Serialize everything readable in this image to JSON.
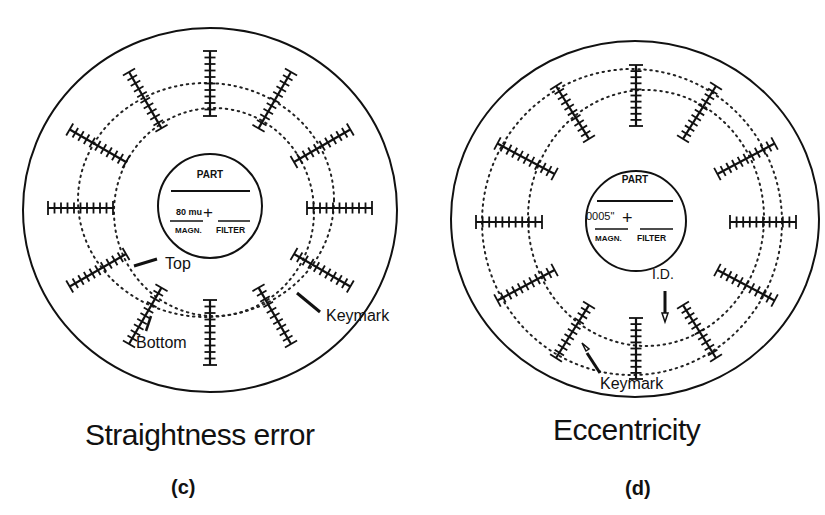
{
  "panels": [
    {
      "id": "c",
      "title": "Straightness error",
      "sub_label": "(c)",
      "center_box": {
        "part_label": "PART",
        "value": "80 mu",
        "plus": "+",
        "magn_label": "MAGN.",
        "filter_label": "FILTER"
      },
      "annotations": [
        {
          "text": "Top"
        },
        {
          "text": "Bottom"
        },
        {
          "text": "Keymark"
        }
      ],
      "tick_bars": 12
    },
    {
      "id": "d",
      "title": "Eccentricity",
      "sub_label": "(d)",
      "center_box": {
        "part_label": "PART",
        "value": "0005\"",
        "plus": "+",
        "magn_label": "MAGN.",
        "filter_label": "FILTER"
      },
      "annotations": [
        {
          "text": "I.D."
        },
        {
          "text": "Keymark"
        }
      ],
      "tick_bars": 12
    }
  ],
  "colors": {
    "ink": "#111111",
    "paper": "#ffffff"
  }
}
